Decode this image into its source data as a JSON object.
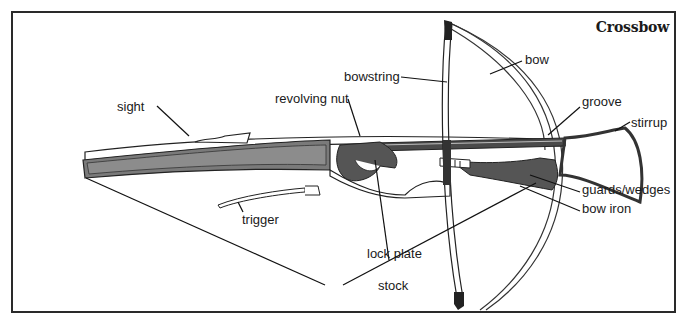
{
  "figure": {
    "title": "Crossbow",
    "labels": {
      "sight": "sight",
      "revolving_nut": "revolving nut",
      "bowstring": "bowstring",
      "bow": "bow",
      "groove": "groove",
      "stirrup": "stirrup",
      "trigger": "trigger",
      "lock_plate": "lock plate",
      "guards_wedges": "guards/wedges",
      "bow_iron": "bow iron",
      "stock": "stock"
    }
  },
  "colors": {
    "frame": "#2a2a2a",
    "ink": "#1a1a1a",
    "stock_fill": "#7a7a7a",
    "metal_fill": "#555555",
    "background": "#ffffff"
  }
}
